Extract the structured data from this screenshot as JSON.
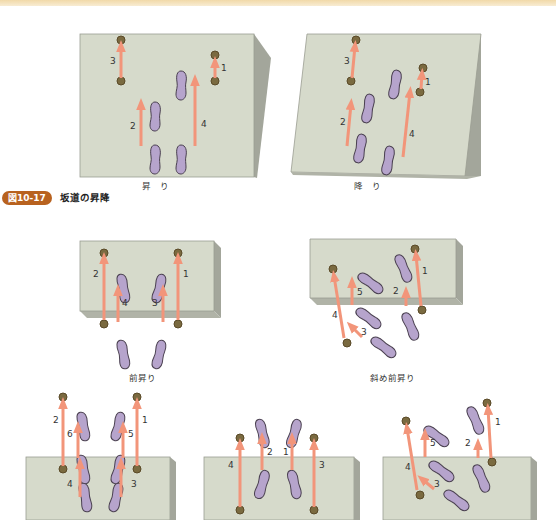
{
  "figure": {
    "number": "図10-17",
    "title": "坂道の昇降"
  },
  "colors": {
    "top_band": "#f1d9a8",
    "slope_face": "#d6dacb",
    "slope_side": "#a3a69b",
    "step_face": "#bfc2b5",
    "foot_fill": "#b6a4cc",
    "foot_stroke": "#4a4050",
    "cane_dot": "#7a6a40",
    "arrow": "#f2957a",
    "badge": "#b8621f"
  },
  "diagrams": [
    {
      "id": "slope-up",
      "caption": "昇　り",
      "labels": [
        "1",
        "2",
        "3",
        "4"
      ]
    },
    {
      "id": "slope-down",
      "caption": "降　り",
      "labels": [
        "1",
        "2",
        "3",
        "4"
      ]
    },
    {
      "id": "stairs-front-up",
      "caption": "前昇り",
      "labels": [
        "1",
        "2",
        "3",
        "4"
      ]
    },
    {
      "id": "stairs-diagonal-up",
      "caption": "斜め前昇り",
      "labels": [
        "1",
        "2",
        "3",
        "4",
        "5"
      ]
    },
    {
      "id": "stairs-front-down",
      "caption": "",
      "labels": [
        "1",
        "2",
        "3",
        "4",
        "5",
        "6"
      ]
    },
    {
      "id": "stairs-front-down-2",
      "caption": "",
      "labels": [
        "1",
        "2",
        "3",
        "4"
      ]
    },
    {
      "id": "stairs-diagonal-down",
      "caption": "",
      "labels": [
        "1",
        "2",
        "3",
        "4",
        "5"
      ]
    }
  ]
}
